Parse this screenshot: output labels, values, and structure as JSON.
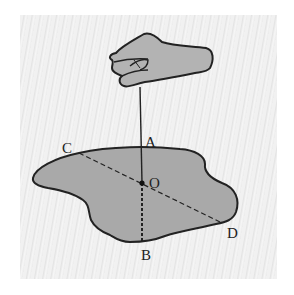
{
  "figure": {
    "labels": {
      "A": "A",
      "B": "B",
      "C": "C",
      "D": "D",
      "O": "O"
    },
    "colors": {
      "plate_fill": "#a9a9a9",
      "hand_fill": "#b3b3b3",
      "outline": "#222222",
      "background": "#efefef"
    },
    "elements": [
      {
        "name": "hand",
        "role": "holding the string"
      },
      {
        "name": "string",
        "from": "hand",
        "to": "A"
      },
      {
        "name": "plate",
        "shape": "irregular thin plate"
      },
      {
        "name": "line-AB",
        "style": "dashed vertical",
        "through": "O"
      },
      {
        "name": "line-CD",
        "style": "dashed diagonal",
        "through": "O"
      },
      {
        "name": "point-O",
        "role": "center of gravity"
      }
    ]
  }
}
